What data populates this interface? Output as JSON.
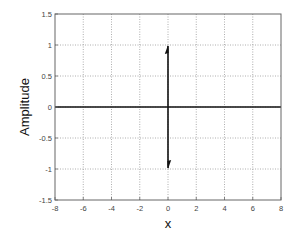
{
  "chart_data": {
    "type": "line",
    "title": "",
    "xlabel": "x",
    "ylabel": "Amplitude",
    "xlim": [
      -8,
      8
    ],
    "ylim": [
      -1.5,
      1.5
    ],
    "x_ticks": [
      -8,
      -6,
      -4,
      -2,
      0,
      2,
      4,
      6,
      8
    ],
    "y_ticks": [
      -1.5,
      -1,
      -0.5,
      0,
      0.5,
      1,
      1.5
    ],
    "x_tick_labels": [
      "-8",
      "-6",
      "-4",
      "-2",
      "0",
      "2",
      "4",
      "6",
      "8"
    ],
    "y_tick_labels": [
      "-1.5",
      "-1",
      "-0.5",
      "0",
      "0.5",
      "1",
      "1.5"
    ],
    "grid": true,
    "grid_style": "dotted",
    "legend": null,
    "series": [
      {
        "name": "baseline",
        "x": [
          -8,
          8
        ],
        "y": [
          0,
          0
        ],
        "style": "solid"
      },
      {
        "name": "impulse-up",
        "type": "arrow",
        "x": 0,
        "from": 0,
        "to": 1
      },
      {
        "name": "impulse-down",
        "type": "arrow",
        "x": 0,
        "from": 0,
        "to": -1
      }
    ]
  },
  "colors": {
    "axes": "#666666",
    "grid": "#999999",
    "data": "#111111",
    "text": "#444444"
  }
}
